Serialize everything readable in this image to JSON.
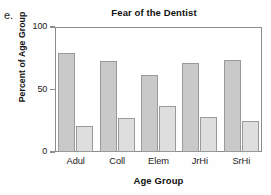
{
  "figure": {
    "label": "e."
  },
  "chart_data": {
    "type": "bar",
    "title": "Fear of the Dentist",
    "xlabel": "Age Group",
    "ylabel": "Percent of Age Group",
    "categories": [
      "Adul",
      "Coll",
      "Elem",
      "JrHi",
      "SrHi"
    ],
    "series": [
      {
        "name": "series-1",
        "values": [
          79,
          73,
          62,
          71,
          74
        ],
        "color": "#c9c9c9"
      },
      {
        "name": "series-2",
        "values": [
          21,
          27,
          37,
          28,
          25
        ],
        "color": "#dedede"
      }
    ],
    "ylim": [
      0,
      100
    ],
    "yticks": [
      0,
      50,
      100
    ],
    "ytick_labels": [
      "0",
      "50",
      "100"
    ],
    "grid": false,
    "legend": "none",
    "bar_outline_color": "#9a9a9a",
    "axis_color": "#8c8c8c"
  }
}
